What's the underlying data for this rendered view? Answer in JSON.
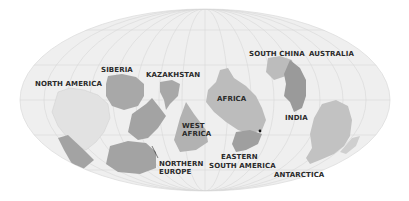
{
  "map": {
    "projection": "mollweide-style ellipse",
    "colors": {
      "ocean": "#efefef",
      "graticule": "#d6d6d6",
      "landmass_dark": "#9f9f9f",
      "landmass_mid": "#b4b4b4",
      "landmass_light": "#c9c9c9",
      "landmass_faint": "#e4e4e4",
      "label": "#2a2a2a",
      "marker": "#111111"
    },
    "labels": [
      {
        "id": "north-america",
        "text": "NORTH AMERICA",
        "x": 35,
        "y": 80
      },
      {
        "id": "siberia",
        "text": "SIBERIA",
        "x": 101,
        "y": 66
      },
      {
        "id": "kazakhstan",
        "text": "KAZAKHSTAN",
        "x": 146,
        "y": 71
      },
      {
        "id": "south-china",
        "text": "SOUTH CHINA",
        "x": 249,
        "y": 50
      },
      {
        "id": "australia",
        "text": "AUSTRALIA",
        "x": 309,
        "y": 50
      },
      {
        "id": "africa",
        "text": "AFRICA",
        "x": 217,
        "y": 95
      },
      {
        "id": "india",
        "text": "INDIA",
        "x": 285,
        "y": 114
      },
      {
        "id": "west-africa-1",
        "text": "WEST",
        "x": 182,
        "y": 122
      },
      {
        "id": "west-africa-2",
        "text": "AFRICA",
        "x": 182,
        "y": 130
      },
      {
        "id": "northern-europe-1",
        "text": "NORTHERN",
        "x": 159,
        "y": 160
      },
      {
        "id": "northern-europe-2",
        "text": "EUROPE",
        "x": 159,
        "y": 168
      },
      {
        "id": "eastern-south-america-1",
        "text": "EASTERN",
        "x": 221,
        "y": 153
      },
      {
        "id": "eastern-south-america-2",
        "text": "SOUTH AMERICA",
        "x": 209,
        "y": 162
      },
      {
        "id": "antarctica",
        "text": "ANTARCTICA",
        "x": 274,
        "y": 171
      }
    ],
    "marker": {
      "x": 260,
      "y": 131
    }
  }
}
